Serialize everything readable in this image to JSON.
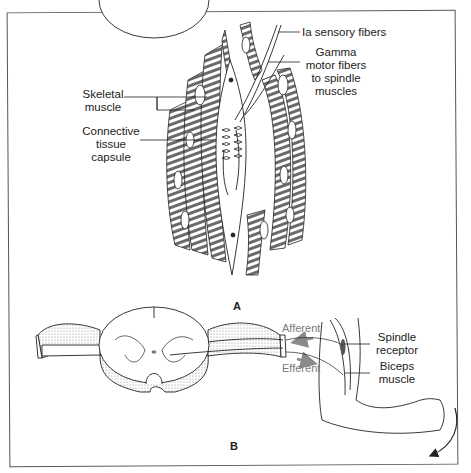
{
  "figure": {
    "panels": [
      {
        "id": "A",
        "label": "A",
        "description": "Muscle spindle within skeletal muscle",
        "labels": {
          "ia_sensory": "Ia sensory fibers",
          "gamma_motor": [
            "Gamma",
            "motor fibers",
            "to spindle",
            "muscles"
          ],
          "skeletal_muscle": [
            "Skeletal",
            "muscle"
          ],
          "capsule": [
            "Connective",
            "tissue",
            "capsule"
          ]
        }
      },
      {
        "id": "B",
        "label": "B",
        "description": "Stretch reflex arc: spinal cord and biceps",
        "labels": {
          "afferent": "Afferent",
          "efferent": "Efferent",
          "spindle_receptor": [
            "Spindle",
            "receptor"
          ],
          "biceps_muscle": [
            "Biceps",
            "muscle"
          ]
        }
      }
    ],
    "colors": {
      "line": "#222222",
      "pathway_arrows": "#8a8a8a",
      "frame": "#555555"
    }
  }
}
